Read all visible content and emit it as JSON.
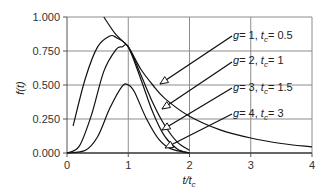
{
  "chart_data": {
    "type": "line",
    "title": "",
    "xlabel": "t/t_c",
    "ylabel": "f(t)",
    "xlim": [
      0,
      4
    ],
    "ylim": [
      0,
      1
    ],
    "x_ticks": [
      "0",
      "1",
      "2",
      "3",
      "4"
    ],
    "y_ticks": [
      "0.000",
      "0.250",
      "0.500",
      "0.750",
      "1.000"
    ],
    "grid": true,
    "legend_position": "annotations-right",
    "series": [
      {
        "name": "g = 1, t_c = 0.5",
        "g": 1,
        "tc": 0.5,
        "x": [
          0.6,
          0.8,
          1.0,
          1.2,
          1.4,
          1.6,
          2.0,
          2.5,
          3.0,
          3.5,
          4.0
        ],
        "values": [
          1.0,
          0.87,
          0.78,
          0.62,
          0.5,
          0.4,
          0.27,
          0.17,
          0.11,
          0.07,
          0.045
        ]
      },
      {
        "name": "g = 2, t_c = 1",
        "g": 2,
        "tc": 1,
        "x": [
          0.1,
          0.3,
          0.5,
          0.7,
          0.8,
          1.0,
          1.2,
          1.4,
          1.6,
          1.8,
          2.0
        ],
        "values": [
          0.2,
          0.55,
          0.78,
          0.86,
          0.85,
          0.78,
          0.58,
          0.37,
          0.2,
          0.08,
          0.02
        ]
      },
      {
        "name": "g = 3, t_c = 1.5",
        "g": 3,
        "tc": 1.5,
        "x": [
          0.0,
          0.2,
          0.4,
          0.6,
          0.8,
          0.9,
          1.0,
          1.2,
          1.4,
          1.6,
          1.8,
          2.0
        ],
        "values": [
          0.0,
          0.05,
          0.28,
          0.6,
          0.76,
          0.78,
          0.78,
          0.55,
          0.3,
          0.12,
          0.03,
          0.0
        ]
      },
      {
        "name": "g = 4, t_c = 3",
        "g": 4,
        "tc": 3,
        "x": [
          0.0,
          0.3,
          0.5,
          0.7,
          0.9,
          1.0,
          1.1,
          1.3,
          1.5,
          1.7,
          2.0
        ],
        "values": [
          0.0,
          0.02,
          0.12,
          0.33,
          0.49,
          0.5,
          0.45,
          0.25,
          0.1,
          0.03,
          0.0
        ]
      }
    ],
    "annotations": [
      {
        "label_g": "g",
        "label_eq1": "= 1, ",
        "label_t": "t",
        "label_c": "c",
        "label_eq2": "= 0.5"
      },
      {
        "label_g": "g",
        "label_eq1": "= 2, ",
        "label_t": "t",
        "label_c": "c",
        "label_eq2": "= 1"
      },
      {
        "label_g": "g",
        "label_eq1": "= 3, ",
        "label_t": "t",
        "label_c": "c",
        "label_eq2": "= 1.5"
      },
      {
        "label_g": "g",
        "label_eq1": "= 4, ",
        "label_t": "t",
        "label_c": "c",
        "label_eq2": "= 3"
      }
    ]
  },
  "axes": {
    "ylabel_f": "f",
    "ylabel_paren": "(t)",
    "xlabel_t": "t/t",
    "xlabel_sub": "c"
  }
}
